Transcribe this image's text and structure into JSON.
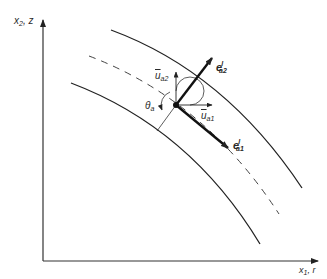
{
  "axes": {
    "y_label": {
      "main": "x",
      "sub": "2",
      "rest": ", z"
    },
    "x_label": {
      "main": "x",
      "sub": "1",
      "rest": ", r"
    }
  },
  "vectors": {
    "e_a2": {
      "main": "e",
      "sup": "l",
      "sub": "a2"
    },
    "e_a1": {
      "main": "e",
      "sup": "l",
      "sub": "a1"
    },
    "u_a2": {
      "main": "u",
      "sub": "a2"
    },
    "u_a1": {
      "main": "u",
      "sub": "a1"
    }
  },
  "angle": {
    "main": "θ",
    "sub": "a"
  },
  "colors": {
    "line": "#222222",
    "background": "#ffffff"
  }
}
